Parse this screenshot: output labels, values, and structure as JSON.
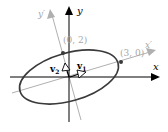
{
  "axes": {
    "x_label": "x",
    "y_label": "y",
    "x_prime_label": "x′",
    "y_prime_label": "y′"
  },
  "points": [
    {
      "label": "(0, 2)",
      "axis": "y-prime"
    },
    {
      "label": "(3, 0)",
      "axis": "x-prime"
    }
  ],
  "vectors": [
    {
      "label": "v1",
      "base": "v",
      "sub": "1"
    },
    {
      "label": "v2",
      "base": "v",
      "sub": "2"
    }
  ],
  "ellipse": {
    "semi_major": 3,
    "semi_minor": 2
  },
  "colors": {
    "axes": "#000000",
    "rotated_axes": "#a8a8a8",
    "ellipse": "#3a3a3a",
    "labels_rotated": "#a8a8a8"
  }
}
